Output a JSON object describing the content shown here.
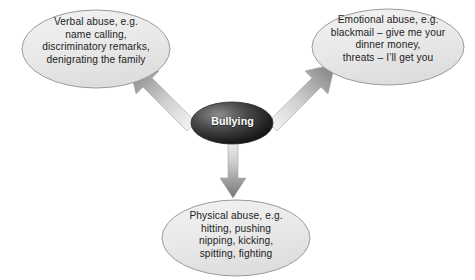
{
  "diagram": {
    "type": "concept-map",
    "title_node": {
      "id": "bullying",
      "label": "Bullying",
      "shape": "ellipse",
      "fill": "#2b2b2b",
      "text_color": "#ffffff"
    },
    "branches": [
      {
        "id": "verbal-abuse",
        "position": "upper-left",
        "shape": "ellipse",
        "fill": "#e9e9e9",
        "stroke": "#9a9a9a",
        "text": "Verbal abuse, e.g.\nname calling,\ndiscriminatory remarks,\ndenigrating the family",
        "lines": [
          "Verbal abuse, e.g.",
          "name calling,",
          "discriminatory remarks,",
          "denigrating the family"
        ]
      },
      {
        "id": "emotional-abuse",
        "position": "upper-right",
        "shape": "ellipse",
        "fill": "#e9e9e9",
        "stroke": "#9a9a9a",
        "text": "Emotional abuse, e.g.\nblackmail – give me your\ndinner money,\nthreats – I’ll get you",
        "lines": [
          "Emotional abuse, e.g.",
          "blackmail – give me your",
          "dinner money,",
          "threats – I’ll get you"
        ]
      },
      {
        "id": "physical-abuse",
        "position": "bottom",
        "shape": "ellipse",
        "fill": "#e9e9e9",
        "stroke": "#9a9a9a",
        "text": "Physical abuse, e.g.\nhitting, pushing\nnipping, kicking,\nspitting, fighting",
        "lines": [
          "Physical abuse, e.g.",
          "hitting, pushing",
          "nipping, kicking,",
          "spitting, fighting"
        ]
      }
    ],
    "connectors": [
      {
        "id": "arrow-to-verbal",
        "name": "block-arrow-up-left-icon",
        "from": "bullying",
        "to": "verbal-abuse",
        "style": "block-arrow-gradient"
      },
      {
        "id": "arrow-to-emotional",
        "name": "block-arrow-up-right-icon",
        "from": "bullying",
        "to": "emotional-abuse",
        "style": "block-arrow-gradient"
      },
      {
        "id": "arrow-to-physical",
        "name": "block-arrow-down-icon",
        "from": "bullying",
        "to": "physical-abuse",
        "style": "block-arrow-gradient"
      }
    ],
    "colors": {
      "background": "#ffffff",
      "leaf_fill": "#e9e9e9",
      "leaf_stroke": "#9a9a9a",
      "center_fill_light": "#6e6e6e",
      "center_fill_dark": "#141414",
      "arrow_light": "#f0f0f0",
      "arrow_dark": "#6f6f6f"
    }
  }
}
